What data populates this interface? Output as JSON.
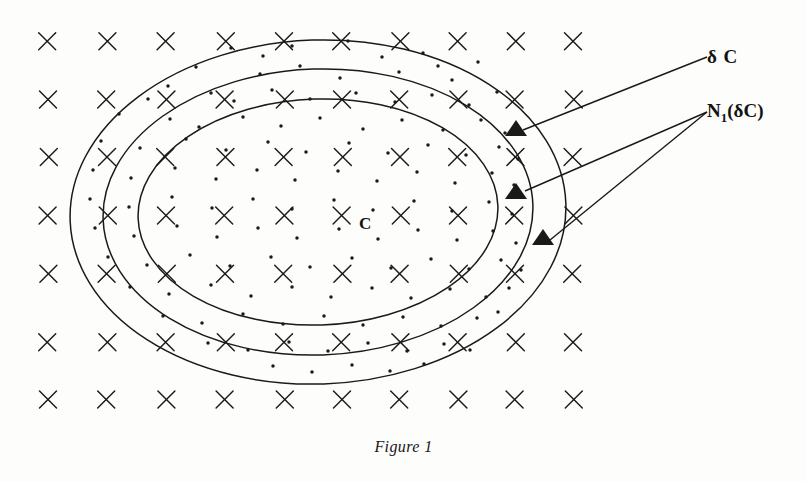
{
  "figure": {
    "caption": "Figure 1",
    "background_color": "#fdfdfc",
    "ink_color": "#1a1a1a",
    "width": 807,
    "height": 482
  },
  "labels": {
    "boundary": "δ C",
    "neighborhood_prefix": "N",
    "neighborhood_subscript": "1",
    "neighborhood_suffix": "(δC)",
    "set_center": "C"
  },
  "legend_semantics": {
    "x_marks": "grid sample points outside/inside region",
    "dots": "dense point cloud within annulus and interior",
    "triangles": "highlighted boundary points"
  },
  "chart_data": {
    "type": "scatter",
    "title": "Figure 1",
    "xlabel": "",
    "ylabel": "",
    "grid": false,
    "legend_position": "right",
    "annotations": [
      {
        "text": "δ C",
        "x": 707,
        "y": 57,
        "leader_to": [
          523,
          130
        ]
      },
      {
        "text": "N₁(δC)",
        "x": 707,
        "y": 112,
        "leader_to": [
          525,
          191
        ]
      },
      {
        "text": "N₁(δC)",
        "x": 707,
        "y": 112,
        "leader_to": [
          550,
          240
        ]
      },
      {
        "text": "C",
        "x": 366,
        "y": 225,
        "leader_to": null
      }
    ],
    "ellipses": [
      {
        "name": "outer",
        "cx": 318,
        "cy": 212,
        "rx": 248,
        "ry": 172,
        "rotation": -2
      },
      {
        "name": "middle",
        "cx": 318,
        "cy": 212,
        "rx": 215,
        "ry": 143,
        "rotation": -2
      },
      {
        "name": "inner",
        "cx": 318,
        "cy": 212,
        "rx": 180,
        "ry": 113,
        "rotation": -2
      }
    ],
    "x_grid": {
      "columns_x": [
        48,
        107,
        166,
        225,
        284,
        342,
        400,
        458,
        515,
        573
      ],
      "rows_y": [
        42,
        100,
        157,
        215,
        273,
        343,
        400
      ],
      "marker": "x",
      "size": 17
    },
    "triangles": [
      {
        "x": 516,
        "y": 128
      },
      {
        "x": 516,
        "y": 191
      },
      {
        "x": 543,
        "y": 237
      }
    ],
    "dots": [
      [
        231,
        48
      ],
      [
        263,
        56
      ],
      [
        292,
        46
      ],
      [
        348,
        41
      ],
      [
        382,
        57
      ],
      [
        423,
        53
      ],
      [
        196,
        67
      ],
      [
        260,
        74
      ],
      [
        300,
        66
      ],
      [
        340,
        78
      ],
      [
        399,
        72
      ],
      [
        438,
        66
      ],
      [
        452,
        80
      ],
      [
        478,
        62
      ],
      [
        168,
        86
      ],
      [
        148,
        99
      ],
      [
        211,
        93
      ],
      [
        234,
        101
      ],
      [
        272,
        90
      ],
      [
        310,
        99
      ],
      [
        356,
        93
      ],
      [
        395,
        102
      ],
      [
        432,
        95
      ],
      [
        469,
        105
      ],
      [
        497,
        92
      ],
      [
        119,
        114
      ],
      [
        170,
        119
      ],
      [
        199,
        127
      ],
      [
        243,
        117
      ],
      [
        281,
        126
      ],
      [
        320,
        118
      ],
      [
        363,
        129
      ],
      [
        402,
        120
      ],
      [
        443,
        130
      ],
      [
        481,
        120
      ],
      [
        505,
        133
      ],
      [
        101,
        141
      ],
      [
        140,
        148
      ],
      [
        186,
        139
      ],
      [
        226,
        150
      ],
      [
        268,
        142
      ],
      [
        306,
        152
      ],
      [
        349,
        143
      ],
      [
        388,
        153
      ],
      [
        428,
        145
      ],
      [
        466,
        155
      ],
      [
        499,
        147
      ],
      [
        518,
        159
      ],
      [
        93,
        170
      ],
      [
        131,
        178
      ],
      [
        175,
        168
      ],
      [
        216,
        179
      ],
      [
        257,
        170
      ],
      [
        295,
        180
      ],
      [
        338,
        171
      ],
      [
        377,
        181
      ],
      [
        417,
        172
      ],
      [
        455,
        183
      ],
      [
        492,
        173
      ],
      [
        514,
        185
      ],
      [
        90,
        199
      ],
      [
        129,
        207
      ],
      [
        172,
        197
      ],
      [
        212,
        208
      ],
      [
        253,
        199
      ],
      [
        292,
        209
      ],
      [
        334,
        200
      ],
      [
        373,
        210
      ],
      [
        414,
        201
      ],
      [
        452,
        211
      ],
      [
        489,
        202
      ],
      [
        512,
        214
      ],
      [
        95,
        228
      ],
      [
        134,
        236
      ],
      [
        177,
        226
      ],
      [
        217,
        237
      ],
      [
        258,
        228
      ],
      [
        297,
        238
      ],
      [
        339,
        229
      ],
      [
        378,
        239
      ],
      [
        418,
        230
      ],
      [
        457,
        240
      ],
      [
        493,
        231
      ],
      [
        516,
        243
      ],
      [
        108,
        257
      ],
      [
        147,
        265
      ],
      [
        190,
        255
      ],
      [
        230,
        266
      ],
      [
        271,
        257
      ],
      [
        310,
        267
      ],
      [
        352,
        258
      ],
      [
        391,
        268
      ],
      [
        431,
        259
      ],
      [
        469,
        269
      ],
      [
        501,
        260
      ],
      [
        521,
        270
      ],
      [
        130,
        287
      ],
      [
        169,
        294
      ],
      [
        211,
        285
      ],
      [
        251,
        296
      ],
      [
        292,
        287
      ],
      [
        331,
        297
      ],
      [
        372,
        288
      ],
      [
        411,
        298
      ],
      [
        450,
        289
      ],
      [
        486,
        297
      ],
      [
        509,
        288
      ],
      [
        163,
        316
      ],
      [
        202,
        323
      ],
      [
        243,
        314
      ],
      [
        283,
        324
      ],
      [
        324,
        316
      ],
      [
        363,
        325
      ],
      [
        403,
        317
      ],
      [
        441,
        326
      ],
      [
        477,
        318
      ],
      [
        498,
        312
      ],
      [
        208,
        343
      ],
      [
        248,
        350
      ],
      [
        289,
        342
      ],
      [
        328,
        351
      ],
      [
        368,
        343
      ],
      [
        407,
        351
      ],
      [
        444,
        344
      ],
      [
        470,
        350
      ],
      [
        273,
        366
      ],
      [
        312,
        372
      ],
      [
        352,
        365
      ],
      [
        390,
        371
      ],
      [
        424,
        364
      ]
    ]
  }
}
